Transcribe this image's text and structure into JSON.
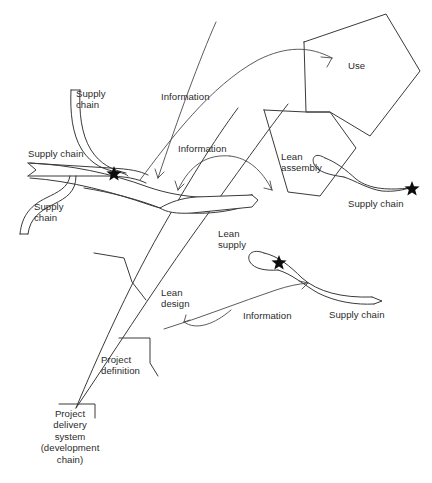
{
  "figure": {
    "type": "conceptual-flow-diagram",
    "title_visible": false,
    "background_color": "#ffffff",
    "line_color": "#3a3a3a",
    "marker_color": "#0d0d0d"
  },
  "labels": {
    "supply_chain_top_left": "Supply\nchain",
    "supply_chain_left": "Supply chain",
    "supply_chain_bottom_left": "Supply\nchain",
    "supply_chain_right": "Supply chain",
    "supply_chain_bottom_right": "Supply chain",
    "information_top": "Information",
    "information_middle": "Information",
    "information_bottom": "Information",
    "use": "Use",
    "lean_assembly": "Lean\nassembly",
    "lean_supply": "Lean\nsupply",
    "lean_design": "Lean\ndesign",
    "project_definition": "Project\ndefinition",
    "project_delivery_system": "Project\ndelivery\nsystem\n(development\nchain)"
  },
  "markers": {
    "star_name": "star-marker",
    "count": 3,
    "positions": [
      {
        "id": "star-left",
        "x": 114,
        "y": 173
      },
      {
        "id": "star-right",
        "x": 412,
        "y": 188
      },
      {
        "id": "star-bottom",
        "x": 279,
        "y": 262
      }
    ]
  },
  "nodes": [
    {
      "id": "use",
      "shape": "polygon",
      "label_key": "use"
    },
    {
      "id": "lean-assembly",
      "shape": "polygon",
      "label_key": "lean_assembly"
    },
    {
      "id": "lean-supply",
      "shape": "arrow-band",
      "label_key": "lean_supply"
    },
    {
      "id": "lean-design",
      "shape": "polygon",
      "label_key": "lean_design"
    },
    {
      "id": "project-definition",
      "shape": "polygon",
      "label_key": "project_definition"
    },
    {
      "id": "project-delivery-system",
      "shape": "polygon",
      "label_key": "project_delivery_system"
    }
  ],
  "flows": [
    {
      "id": "supply-chain-top-left",
      "kind": "band",
      "label_key": "supply_chain_top_left"
    },
    {
      "id": "supply-chain-left",
      "kind": "band-notched-tail",
      "label_key": "supply_chain_left"
    },
    {
      "id": "supply-chain-bottom-left",
      "kind": "band",
      "label_key": "supply_chain_bottom_left"
    },
    {
      "id": "supply-chain-right",
      "kind": "loop-taper",
      "label_key": "supply_chain_right"
    },
    {
      "id": "supply-chain-bottom-right",
      "kind": "loop-band-notched-tail",
      "label_key": "supply_chain_bottom_right"
    },
    {
      "id": "information-top",
      "kind": "curved-arrow",
      "label_key": "information_top"
    },
    {
      "id": "information-middle-left",
      "kind": "curved-arrow",
      "label_key": "information_middle"
    },
    {
      "id": "information-middle-right",
      "kind": "curved-arrow",
      "label_key": "information_middle"
    },
    {
      "id": "information-bottom",
      "kind": "curved-arrow",
      "label_key": "information_bottom"
    },
    {
      "id": "lean-design-arrow",
      "kind": "curved-arrow",
      "label_key": "lean_design"
    }
  ]
}
